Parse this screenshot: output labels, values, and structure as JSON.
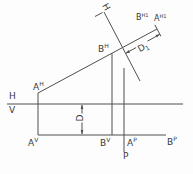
{
  "diagram": {
    "points": {
      "a_h": {
        "base": "A",
        "sup": "H"
      },
      "b_h": {
        "base": "B",
        "sup": "H"
      },
      "b_h1": {
        "base": "B",
        "sup": "H1"
      },
      "a_h1": {
        "base": "A",
        "sup": "H1"
      },
      "a_v": {
        "base": "A",
        "sup": "V"
      },
      "b_v": {
        "base": "B",
        "sup": "V"
      },
      "a_p": {
        "base": "A",
        "sup": "P"
      },
      "b_p": {
        "base": "B",
        "sup": "P"
      }
    },
    "planes": {
      "h": "H",
      "v": "V",
      "p": "P",
      "fold_h": "H"
    },
    "dimensions": {
      "d": {
        "base": "D"
      },
      "d1": {
        "base": "D",
        "sub": "1"
      }
    },
    "colors": {
      "line": "#4f4f4f",
      "text": "#383838",
      "background": "#fdfdfd"
    }
  }
}
